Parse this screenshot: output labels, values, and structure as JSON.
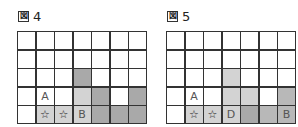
{
  "figures": [
    {
      "label_mark": "図",
      "number": "4",
      "cols": 7,
      "rows": 5,
      "cells": [
        [
          "w",
          "w",
          "w",
          "w",
          "w",
          "w",
          "w"
        ],
        [
          "w",
          "w",
          "w",
          "w",
          "w",
          "w",
          "w"
        ],
        [
          "w",
          "w",
          "w",
          "dark",
          "w",
          "w",
          "w"
        ],
        [
          "w",
          "w:A",
          "w",
          "light",
          "dark",
          "w",
          "dark"
        ],
        [
          "w",
          "light:☆",
          "light:☆",
          "light:B",
          "dark",
          "dark",
          "dark"
        ]
      ]
    },
    {
      "label_mark": "図",
      "number": "5",
      "cols": 7,
      "rows": 5,
      "cells": [
        [
          "w",
          "w",
          "w",
          "w",
          "w",
          "w",
          "w"
        ],
        [
          "w",
          "w",
          "w",
          "w",
          "w",
          "w",
          "w"
        ],
        [
          "w",
          "w",
          "w",
          "light",
          "w",
          "w",
          "w"
        ],
        [
          "w",
          "w:A",
          "w",
          "light",
          "light",
          "w",
          "mid"
        ],
        [
          "w",
          "light:☆",
          "light:☆",
          "light:D",
          "dark",
          "mid",
          "mid:B"
        ]
      ]
    }
  ],
  "colors": {
    "white": "#ffffff",
    "light": "#d3d3d3",
    "mid": "#b8b8b8",
    "dark": "#a9a9a9",
    "border": "#333333"
  }
}
